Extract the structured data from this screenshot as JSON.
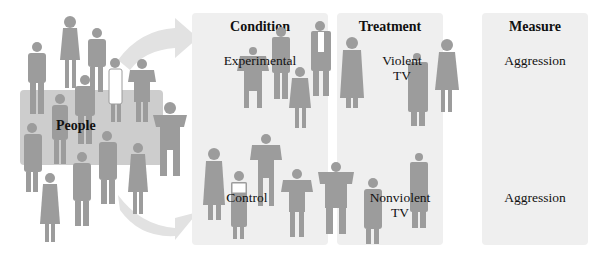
{
  "diagram": {
    "group_label": "People",
    "columns": [
      {
        "header": "Condition",
        "rows": [
          "Experimental",
          "Control"
        ]
      },
      {
        "header": "Treatment",
        "rows": [
          "Violent\nTV",
          "Nonviolent\nTV"
        ]
      },
      {
        "header": "Measure",
        "rows": [
          "Aggression",
          "Aggression"
        ]
      }
    ],
    "treatment_rows": [
      {
        "line1": "Violent",
        "line2": "TV"
      },
      {
        "line1": "Nonviolent",
        "line2": "TV"
      }
    ],
    "colors": {
      "panel": "#efefef",
      "figure": "#9a9a9a",
      "people_box": "#cdcdcd",
      "arrow": "#dedede",
      "text": "#111111"
    }
  }
}
